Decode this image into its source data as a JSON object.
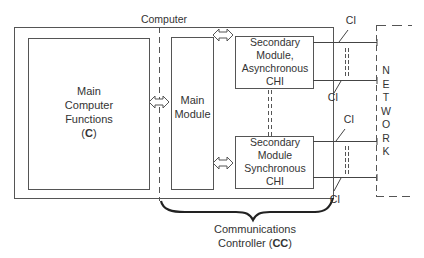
{
  "diagram": {
    "computer_label": "Computer",
    "main_functions": {
      "line1": "Main",
      "line2": "Computer",
      "line3": "Functions",
      "abbr_open": "(",
      "abbr": "C",
      "abbr_close": ")"
    },
    "main_module": {
      "line1": "Main",
      "line2": "Module"
    },
    "secondary_async": {
      "line1": "Secondary",
      "line2": "Module,",
      "line3": "Asynchronous",
      "line4": "CHI"
    },
    "secondary_sync": {
      "line1": "Secondary",
      "line2": "Module",
      "line3": "Synchronous",
      "line4": "CHI"
    },
    "ci_labels": [
      "CI",
      "CI",
      "CI",
      "CI"
    ],
    "network_letters": [
      "N",
      "E",
      "T",
      "W",
      "O",
      "R",
      "K"
    ],
    "controller": {
      "line1": "Communications",
      "line2_prefix": "Controller (",
      "line2_abbr": "CC",
      "line2_suffix": ")"
    }
  }
}
